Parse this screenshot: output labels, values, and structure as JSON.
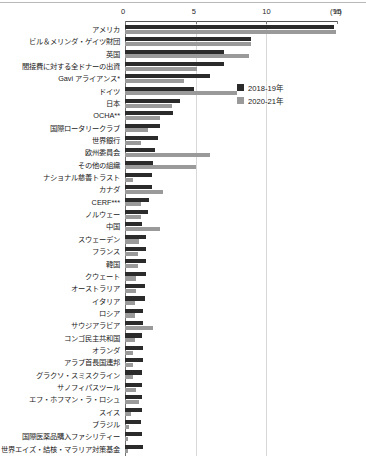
{
  "chart_data": {
    "type": "bar",
    "orientation": "horizontal",
    "title": "",
    "xlabel": "(%)",
    "ylabel": "",
    "xlim": [
      0,
      15
    ],
    "xticks": [
      0,
      5,
      10,
      15
    ],
    "xtick_labels": [
      "0",
      "5",
      "10",
      "15"
    ],
    "unit_label": "(%)",
    "grid": true,
    "legend_position": "upper-right-inside",
    "categories": [
      "アメリカ",
      "ビル＆メリンダ・ゲイツ財団",
      "英国",
      "間接費に対する全ドナーの出資",
      "Gavi アライアンス*",
      "ドイツ",
      "日本",
      "OCHA**",
      "国際ロータリークラブ",
      "世界銀行",
      "欧州委員会",
      "その他の組織",
      "ナショナル慈善トラスト",
      "カナダ",
      "CERF***",
      "ノルウェー",
      "中国",
      "スウェーデン",
      "フランス",
      "韓国",
      "クウェート",
      "オーストラリア",
      "イタリア",
      "ロシア",
      "サウジアラビア",
      "コンゴ民主共和国",
      "オランダ",
      "アラブ首長国連邦",
      "グラクソ・スミスクライン",
      "サノフィパスツール",
      "エフ・ホフマン・ラ・ロシュ",
      "スイス",
      "ブラジル",
      "国際医薬品購入ファシリティー",
      "世界エイズ・結核・マラリア対策基金"
    ],
    "series": [
      {
        "name": "2018-19年",
        "color": "#2b2b2b",
        "values": [
          14.8,
          8.9,
          7.0,
          7.0,
          6.0,
          4.9,
          3.9,
          3.4,
          2.5,
          2.3,
          2.1,
          2.0,
          1.9,
          1.9,
          1.7,
          1.6,
          1.2,
          1.5,
          1.5,
          1.5,
          1.5,
          1.4,
          1.4,
          1.3,
          1.3,
          1.2,
          1.3,
          1.3,
          1.2,
          1.2,
          1.2,
          1.2,
          1.1,
          1.2,
          1.3
        ]
      },
      {
        "name": "2020-21年",
        "color": "#9a9a9a",
        "values": [
          14.9,
          8.9,
          8.8,
          5.1,
          4.2,
          7.9,
          3.3,
          2.5,
          1.6,
          1.1,
          6.0,
          5.0,
          0.6,
          2.7,
          1.1,
          1.1,
          2.5,
          1.0,
          0.9,
          0.9,
          0.8,
          0.8,
          0.7,
          0.7,
          2.0,
          0.7,
          0.6,
          0.6,
          0.6,
          0.8,
          1.0,
          0.4,
          0.3,
          0.2,
          0.2
        ]
      }
    ]
  },
  "legend": {
    "items": [
      {
        "label": "2018-19年",
        "color": "#2b2b2b"
      },
      {
        "label": "2020-21年",
        "color": "#9a9a9a"
      }
    ]
  }
}
